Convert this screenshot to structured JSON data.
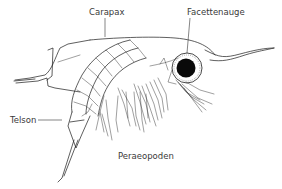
{
  "diagram": {
    "labels": [
      {
        "id": "carapax",
        "text": "Carapax"
      },
      {
        "id": "facettenauge",
        "text": "Facettenauge"
      },
      {
        "id": "telson",
        "text": "Telson"
      },
      {
        "id": "peraeopoden",
        "text": "Peraeopoden"
      }
    ],
    "colors": {
      "ink": "#1a1a1a",
      "label": "#3a3a3a",
      "background": "#ffffff"
    }
  }
}
